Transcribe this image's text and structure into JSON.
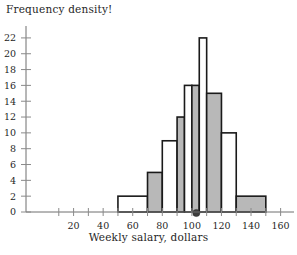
{
  "chart_data": {
    "type": "bar",
    "title": "Frequency density!",
    "xlabel": "Weekly salary, dollars",
    "ylabel": "",
    "xlim": [
      0,
      165
    ],
    "ylim": [
      0,
      23
    ],
    "grid": false,
    "legend": "none",
    "xticks": [
      20,
      40,
      60,
      80,
      100,
      120,
      140,
      160
    ],
    "xtick_labels": [
      "20",
      "40",
      "60",
      "80",
      "100",
      "120",
      "140",
      "160"
    ],
    "xminor_ticks": [
      10,
      30,
      50,
      70,
      90,
      110,
      130,
      150
    ],
    "yticks": [
      0,
      2,
      4,
      6,
      8,
      10,
      12,
      14,
      16,
      18,
      20,
      22
    ],
    "ytick_labels": [
      "0",
      "2",
      "4",
      "6",
      "8",
      "10",
      "12",
      "14",
      "16",
      "18",
      "20",
      "22"
    ],
    "bins": [
      {
        "x0": 50,
        "x1": 70,
        "height": 2,
        "fill": "open",
        "label": "50-70"
      },
      {
        "x0": 70,
        "x1": 80,
        "height": 5,
        "fill": "shaded",
        "label": "70-80"
      },
      {
        "x0": 80,
        "x1": 90,
        "height": 9,
        "fill": "open",
        "label": "80-90"
      },
      {
        "x0": 90,
        "x1": 95,
        "height": 12,
        "fill": "shaded",
        "label": "90-95"
      },
      {
        "x0": 95,
        "x1": 100,
        "height": 16,
        "fill": "open",
        "label": "95-100"
      },
      {
        "x0": 100,
        "x1": 105,
        "height": 16,
        "fill": "shaded",
        "label": "100-105"
      },
      {
        "x0": 105,
        "x1": 110,
        "height": 22,
        "fill": "open",
        "label": "105-110"
      },
      {
        "x0": 110,
        "x1": 120,
        "height": 15,
        "fill": "shaded",
        "label": "110-120"
      },
      {
        "x0": 120,
        "x1": 130,
        "height": 10,
        "fill": "open",
        "label": "120-130"
      },
      {
        "x0": 130,
        "x1": 150,
        "height": 2,
        "fill": "shaded",
        "label": "130-150"
      }
    ],
    "markers": [
      {
        "x": 103,
        "y": 0,
        "shape": "dot",
        "name": "median-marker"
      }
    ],
    "colors": {
      "shaded_fill": "#b8b8b8",
      "open_fill": "#ffffff",
      "bar_stroke": "#1a1a1a",
      "axis": "#6f6f6f",
      "text": "#1f1f1f",
      "marker": "#3d3d3d"
    }
  }
}
